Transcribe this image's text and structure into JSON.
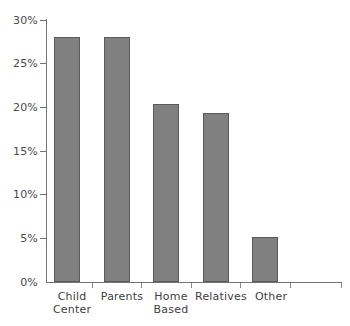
{
  "chart_data": {
    "type": "bar",
    "title": "",
    "subtitle": "",
    "xlabel": "",
    "ylabel": "",
    "categories": [
      "Child Center",
      "Parents",
      "Home Based",
      "Relatives",
      "Other"
    ],
    "values": [
      28.1,
      28.1,
      20.4,
      19.3,
      5.2
    ],
    "value_suffix": "%",
    "ylim": [
      0,
      30
    ],
    "ytick_values": [
      0,
      5,
      10,
      15,
      20,
      25,
      30
    ],
    "ytick_labels": [
      "0%",
      "5%",
      "10%",
      "15%",
      "20%",
      "25%",
      "30%"
    ],
    "grid": false,
    "legend": false,
    "legend_position": "none",
    "series": [
      {
        "name": "Share of children",
        "values": [
          28.1,
          28.1,
          20.4,
          19.3,
          5.2
        ]
      }
    ],
    "colors": {
      "bar_fill": "#808080",
      "bar_border": "#5a5a5a",
      "axis": "#737373",
      "tick_label": "#4a4a4a",
      "category_label": "#3f3f3f",
      "background": "#ffffff"
    }
  },
  "axis": {
    "y_labels": [
      {
        "text": "30%",
        "value": 30
      },
      {
        "text": "25%",
        "value": 25
      },
      {
        "text": "20%",
        "value": 20
      },
      {
        "text": "15%",
        "value": 15
      },
      {
        "text": "10%",
        "value": 10
      },
      {
        "text": "5%",
        "value": 5
      },
      {
        "text": "0%",
        "value": 0
      }
    ],
    "x_labels": [
      {
        "line1": "Child",
        "line2": "Center",
        "text": "Child\nCenter"
      },
      {
        "line1": "Parents",
        "line2": "",
        "text": "Parents"
      },
      {
        "line1": "Home",
        "line2": "Based",
        "text": "Home\nBased"
      },
      {
        "line1": "Relatives",
        "line2": "",
        "text": "Relatives"
      },
      {
        "line1": "Other",
        "line2": "",
        "text": "Other"
      }
    ]
  }
}
